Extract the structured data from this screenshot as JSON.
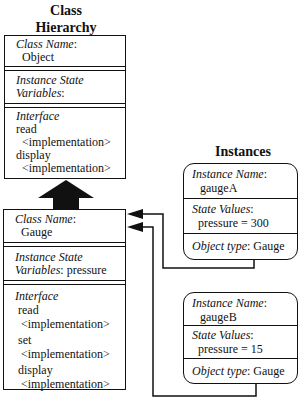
{
  "titles": {
    "class_hierarchy_line1": "Class",
    "class_hierarchy_line2": "Hierarchy",
    "instances": "Instances"
  },
  "classes": [
    {
      "class_name_label": "Class Name",
      "class_name": "Object",
      "state_label_1": "Instance State",
      "state_label_2": "Variables",
      "state_vars": "",
      "interface_label": "Interface",
      "methods": [
        {
          "name": "read",
          "impl": "<implementation>"
        },
        {
          "name": "display",
          "impl": "<implementation>"
        }
      ]
    },
    {
      "class_name_label": "Class Name",
      "class_name": "Gauge",
      "state_label_1": "Instance State",
      "state_label_2": "Variables",
      "state_vars": "pressure",
      "interface_label": "Interface",
      "methods": [
        {
          "name": "read",
          "impl": "<implementation>"
        },
        {
          "name": "set",
          "impl": "<implementation>"
        },
        {
          "name": "display",
          "impl": "<implementation>"
        }
      ]
    }
  ],
  "instances": [
    {
      "name_label": "Instance Name",
      "name": "gaugeA",
      "state_label": "State Values",
      "state_value": "pressure = 300",
      "type_label": "Object type",
      "type": "Gauge"
    },
    {
      "name_label": "Instance Name",
      "name": "gaugeB",
      "state_label": "State Values",
      "state_value": "pressure = 15",
      "type_label": "Object type",
      "type": "Gauge"
    }
  ],
  "colors": {
    "line": "#111111",
    "background": "#ffffff"
  }
}
